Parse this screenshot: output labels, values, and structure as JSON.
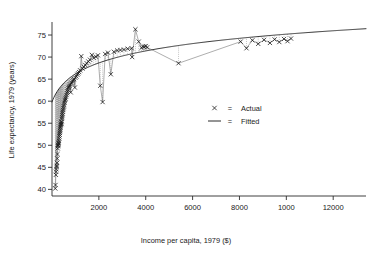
{
  "chart_data": {
    "type": "scatter",
    "title": "",
    "xlabel": "Income per capita, 1979 ($)",
    "ylabel": "Life expectancy, 1979 (years)",
    "xlim": [
      0,
      13400
    ],
    "ylim": [
      38.5,
      77.5
    ],
    "xticks": [
      2000,
      4000,
      6000,
      8000,
      10000,
      12000
    ],
    "xticklabels": [
      "2000",
      "4000",
      "6000",
      "8000",
      "1000",
      "12000"
    ],
    "yticks": [
      40,
      45,
      50,
      55,
      60,
      65,
      70,
      75
    ],
    "yticklabels": [
      "40",
      "45",
      "50",
      "55",
      "60",
      "65",
      "70",
      "75"
    ],
    "grid": false,
    "legend_position": "center-right",
    "legend": [
      {
        "marker": "x",
        "equals": "=",
        "label": "Actual"
      },
      {
        "marker": "line",
        "equals": "=",
        "label": "Fitted"
      }
    ],
    "series": [
      {
        "name": "Actual",
        "marker": "x",
        "color": "#1a1a1a",
        "points": [
          [
            140,
            40.2
          ],
          [
            150,
            41.0
          ],
          [
            165,
            43.3
          ],
          [
            175,
            44.0
          ],
          [
            185,
            44.6
          ],
          [
            195,
            45.1
          ],
          [
            205,
            45.4
          ],
          [
            215,
            46.0
          ],
          [
            225,
            47.0
          ],
          [
            235,
            48.0
          ],
          [
            245,
            49.3
          ],
          [
            255,
            49.8
          ],
          [
            262,
            50.0
          ],
          [
            270,
            50.1
          ],
          [
            278,
            50.4
          ],
          [
            286,
            50.6
          ],
          [
            295,
            51.0
          ],
          [
            305,
            51.5
          ],
          [
            315,
            52.0
          ],
          [
            325,
            52.4
          ],
          [
            335,
            52.8
          ],
          [
            345,
            53.2
          ],
          [
            352,
            53.6
          ],
          [
            360,
            54.0
          ],
          [
            368,
            54.3
          ],
          [
            376,
            54.6
          ],
          [
            385,
            54.9
          ],
          [
            395,
            55.2
          ],
          [
            405,
            54.8
          ],
          [
            415,
            55.4
          ],
          [
            425,
            56.0
          ],
          [
            435,
            56.4
          ],
          [
            445,
            56.8
          ],
          [
            455,
            57.2
          ],
          [
            465,
            57.6
          ],
          [
            478,
            58.0
          ],
          [
            490,
            58.4
          ],
          [
            505,
            58.8
          ],
          [
            520,
            59.2
          ],
          [
            535,
            59.6
          ],
          [
            550,
            60.0
          ],
          [
            565,
            60.3
          ],
          [
            580,
            60.6
          ],
          [
            600,
            61.0
          ],
          [
            620,
            61.4
          ],
          [
            640,
            61.8
          ],
          [
            660,
            62.2
          ],
          [
            680,
            62.6
          ],
          [
            700,
            63.0
          ],
          [
            720,
            63.2
          ],
          [
            745,
            63.5
          ],
          [
            770,
            63.8
          ],
          [
            800,
            62.0
          ],
          [
            820,
            64.0
          ],
          [
            850,
            64.2
          ],
          [
            880,
            64.5
          ],
          [
            910,
            64.8
          ],
          [
            940,
            65.0
          ],
          [
            975,
            63.1
          ],
          [
            1000,
            65.3
          ],
          [
            1040,
            65.6
          ],
          [
            1080,
            66.0
          ],
          [
            1120,
            66.3
          ],
          [
            1160,
            66.6
          ],
          [
            1200,
            67.0
          ],
          [
            1250,
            70.2
          ],
          [
            1300,
            67.4
          ],
          [
            1360,
            67.8
          ],
          [
            1420,
            68.2
          ],
          [
            1480,
            68.6
          ],
          [
            1550,
            69.0
          ],
          [
            1620,
            69.4
          ],
          [
            1700,
            70.5
          ],
          [
            1780,
            69.8
          ],
          [
            1870,
            70.1
          ],
          [
            1960,
            70.4
          ],
          [
            2060,
            63.5
          ],
          [
            2160,
            59.8
          ],
          [
            2270,
            70.7
          ],
          [
            2390,
            71.0
          ],
          [
            2510,
            66.1
          ],
          [
            2640,
            71.2
          ],
          [
            2780,
            71.5
          ],
          [
            2920,
            71.6
          ],
          [
            3070,
            71.7
          ],
          [
            3230,
            71.9
          ],
          [
            3400,
            72.0
          ],
          [
            3420,
            70.0
          ],
          [
            3560,
            76.3
          ],
          [
            3700,
            73.5
          ],
          [
            3820,
            72.1
          ],
          [
            3880,
            72.4
          ],
          [
            3940,
            72.3
          ],
          [
            4000,
            72.5
          ],
          [
            4060,
            72.2
          ],
          [
            5400,
            68.6
          ],
          [
            8050,
            73.5
          ],
          [
            8300,
            72.0
          ],
          [
            8550,
            73.8
          ],
          [
            8800,
            73.0
          ],
          [
            9050,
            73.9
          ],
          [
            9300,
            73.2
          ],
          [
            9500,
            74.0
          ],
          [
            9700,
            73.4
          ],
          [
            9900,
            74.1
          ],
          [
            10050,
            73.6
          ],
          [
            10200,
            74.2
          ]
        ]
      },
      {
        "name": "Fitted",
        "marker": "line",
        "color": "#2b2b2b",
        "description": "Smooth concave increasing curve rising steeply from about 49 years at low income and flattening toward about 76 years at the highest incomes"
      }
    ],
    "annotations": [
      {
        "kind": "residual-lines",
        "description": "Light dotted vertical segments connect each actual point to the fitted curve"
      },
      {
        "kind": "connector-path",
        "description": "Thin grey polyline joins consecutive actual observations in income order"
      }
    ]
  }
}
